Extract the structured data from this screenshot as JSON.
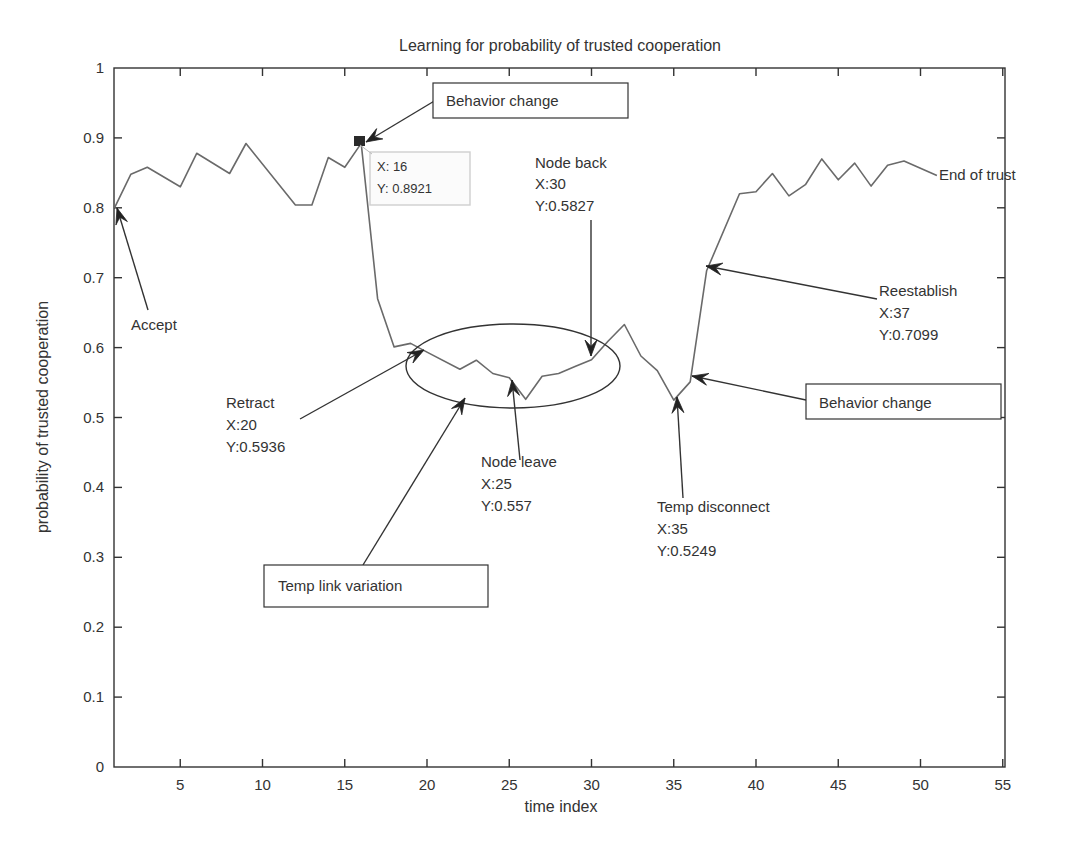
{
  "chart_data": {
    "type": "line",
    "title": "Learning for probability of trusted cooperation",
    "xlabel": "time index",
    "ylabel": "probability of trusted cooperation",
    "xlim": [
      0,
      55
    ],
    "ylim": [
      0,
      1
    ],
    "grid": false,
    "legend": null,
    "xticks": [
      5,
      10,
      15,
      20,
      25,
      30,
      35,
      40,
      45,
      50,
      55
    ],
    "yticks": [
      0,
      0.1,
      0.2,
      0.3,
      0.4,
      0.5,
      0.6,
      0.7,
      0.8,
      0.9,
      1
    ],
    "ytick_labels": [
      "0",
      "0.1",
      "0.2",
      "0.3",
      "0.4",
      "0.5",
      "0.6",
      "0.7",
      "0.8",
      "0.9",
      "1"
    ],
    "series": [
      {
        "name": "trusted cooperation probability",
        "x": [
          1,
          2,
          3,
          5,
          6,
          8,
          9,
          12,
          13,
          14,
          15,
          16,
          17,
          18,
          19,
          20,
          22,
          23,
          24,
          25,
          26,
          27,
          28,
          29,
          30,
          31,
          32,
          33,
          34,
          35,
          36,
          37,
          39,
          40,
          41,
          42,
          43,
          44,
          45,
          46,
          47,
          48,
          49,
          51
        ],
        "values": [
          0.8,
          0.848,
          0.858,
          0.83,
          0.878,
          0.849,
          0.892,
          0.804,
          0.804,
          0.872,
          0.858,
          0.8921,
          0.67,
          0.601,
          0.606,
          0.5936,
          0.569,
          0.582,
          0.563,
          0.557,
          0.526,
          0.559,
          0.563,
          0.573,
          0.5827,
          0.609,
          0.633,
          0.588,
          0.567,
          0.5249,
          0.551,
          0.7099,
          0.82,
          0.823,
          0.849,
          0.817,
          0.833,
          0.87,
          0.84,
          0.864,
          0.831,
          0.861,
          0.867,
          0.846
        ]
      }
    ],
    "datatip": {
      "x_label": "X: 16",
      "y_label": "Y: 0.8921",
      "x": 16,
      "y": 0.8921
    },
    "annotations": [
      {
        "id": "accept",
        "lines": [
          "Accept"
        ],
        "boxed": false,
        "target": [
          1,
          0.8
        ]
      },
      {
        "id": "behavior-change-1",
        "lines": [
          "Behavior change"
        ],
        "boxed": true,
        "target": [
          16,
          0.8921
        ]
      },
      {
        "id": "node-back",
        "lines": [
          "Node back",
          "X:30",
          "Y:0.5827"
        ],
        "boxed": false,
        "target": [
          30,
          0.5827
        ]
      },
      {
        "id": "retract",
        "lines": [
          "Retract",
          "X:20",
          "Y:0.5936"
        ],
        "boxed": false,
        "target": [
          20,
          0.5936
        ]
      },
      {
        "id": "node-leave",
        "lines": [
          "Node leave",
          "X:25",
          "Y:0.557"
        ],
        "boxed": false,
        "target": [
          25,
          0.557
        ]
      },
      {
        "id": "temp-link-variation",
        "lines": [
          "Temp link variation"
        ],
        "boxed": true,
        "target": "ellipse"
      },
      {
        "id": "temp-disconnect",
        "lines": [
          "Temp disconnect",
          "X:35",
          "Y:0.5249"
        ],
        "boxed": false,
        "target": [
          35,
          0.5249
        ]
      },
      {
        "id": "behavior-change-2",
        "lines": [
          "Behavior change"
        ],
        "boxed": true,
        "target": [
          36,
          0.551
        ]
      },
      {
        "id": "reestablish",
        "lines": [
          "Reestablish",
          "X:37",
          "Y:0.7099"
        ],
        "boxed": false,
        "target": [
          37,
          0.7099
        ]
      },
      {
        "id": "end-of-trust",
        "lines": [
          "End of trust"
        ],
        "boxed": false,
        "target": [
          51,
          0.846
        ]
      }
    ],
    "ellipse": {
      "cx": 25.7,
      "cy": 0.573,
      "rx_units": 6.5,
      "ry_value": 0.06
    }
  }
}
